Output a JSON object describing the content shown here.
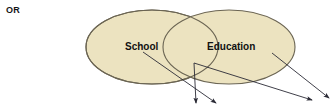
{
  "figure": {
    "prefix_label": "OR",
    "background_color": "#ffffff"
  },
  "venn": {
    "fill_color": "#ece3c0",
    "stroke_color": "#6b6553",
    "sets": [
      {
        "id": "school",
        "label": "School",
        "cx": 152,
        "cy": 47,
        "rx": 66,
        "ry": 37,
        "label_x": 125,
        "label_y": 50
      },
      {
        "id": "education",
        "label": "Education",
        "cx": 229,
        "cy": 47,
        "rx": 66,
        "ry": 37,
        "label_x": 207,
        "label_y": 50
      }
    ]
  },
  "arrows": {
    "color": "#2a2a35",
    "items": [
      {
        "id": "school-to-instance-1",
        "from_x": 143,
        "from_y": 52,
        "to_x": 216,
        "to_y": 103
      },
      {
        "id": "overlap-to-instance-1",
        "from_x": 194,
        "from_y": 63,
        "to_x": 196,
        "to_y": 103
      },
      {
        "id": "overlap-to-instance-2",
        "from_x": 194,
        "from_y": 63,
        "to_x": 312,
        "to_y": 100
      },
      {
        "id": "education-to-instance-2",
        "from_x": 272,
        "from_y": 53,
        "to_x": 329,
        "to_y": 98
      }
    ]
  }
}
